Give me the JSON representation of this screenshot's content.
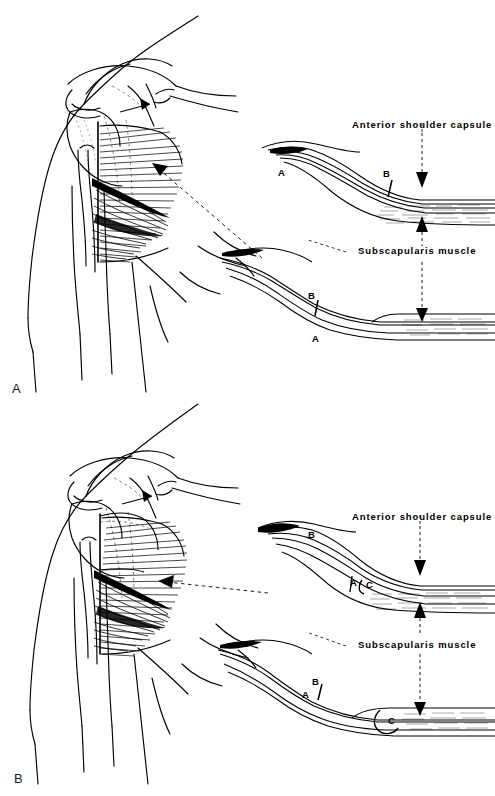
{
  "figure": {
    "type": "medical-anatomical-illustration",
    "background_color": "#ffffff",
    "ink_color": "#000000",
    "panel_count": 2
  },
  "panels": [
    {
      "id": "A",
      "label": "A",
      "anatomy_drawing": {
        "name": "anterior-shoulder-dissection-view",
        "description": "Line drawing of left anterior shoulder showing clavicle, acromion, coracoid, humeral head, biceps tendon and subscapularis muscle fibers"
      },
      "callouts": [
        {
          "id": "capsule",
          "label": "Anterior shoulder capsule",
          "x": 352,
          "y": 124
        },
        {
          "id": "subscapularis",
          "label": "Subscapularis muscle",
          "x": 358,
          "y": 250
        }
      ],
      "schematics": [
        {
          "id": "upper",
          "name": "capsule-cross-section-upper",
          "markers": [
            {
              "label": "A",
              "x": 281,
              "y": 172
            },
            {
              "label": "B",
              "x": 387,
              "y": 172
            }
          ]
        },
        {
          "id": "lower",
          "name": "subscapularis-cross-section-lower",
          "markers": [
            {
              "label": "B",
              "x": 312,
              "y": 295
            },
            {
              "label": "A",
              "x": 316,
              "y": 338
            }
          ]
        }
      ]
    },
    {
      "id": "B",
      "label": "B",
      "anatomy_drawing": {
        "name": "anterior-shoulder-dissection-view",
        "description": "Line drawing of left anterior shoulder after capsular shift, showing overlapping flaps"
      },
      "callouts": [
        {
          "id": "capsule",
          "label": "Anterior shoulder capsule",
          "x": 352,
          "y": 518
        },
        {
          "id": "subscapularis",
          "label": "Subscapularis muscle",
          "x": 358,
          "y": 645
        }
      ],
      "schematics": [
        {
          "id": "upper",
          "name": "capsule-cross-section-upper",
          "markers": [
            {
              "label": "B",
              "x": 313,
              "y": 534
            },
            {
              "label": "A",
              "x": 355,
              "y": 580
            },
            {
              "label": "C",
              "x": 372,
              "y": 582
            }
          ]
        },
        {
          "id": "lower",
          "name": "subscapularis-cross-section-lower",
          "markers": [
            {
              "label": "B",
              "x": 316,
              "y": 680
            },
            {
              "label": "A",
              "x": 306,
              "y": 693
            },
            {
              "label": "C",
              "x": 392,
              "y": 716
            }
          ]
        }
      ]
    }
  ],
  "labels": {
    "capsule": "Anterior shoulder capsule",
    "subscapularis": "Subscapularis muscle",
    "panel_a": "A",
    "panel_b": "B",
    "marker_a": "A",
    "marker_b": "B",
    "marker_c": "C"
  }
}
